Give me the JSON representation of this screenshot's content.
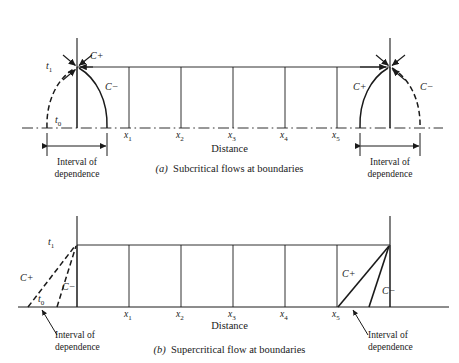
{
  "figure": {
    "axis_label": "Distance",
    "interval_label_line1": "Interval of",
    "interval_label_line2": "dependence",
    "tick_labels": [
      "x1",
      "x2",
      "x3",
      "x4",
      "x5"
    ],
    "tick_bases": [
      "x",
      "x",
      "x",
      "x",
      "x"
    ],
    "tick_subs": [
      "1",
      "2",
      "3",
      "4",
      "5"
    ],
    "time_levels": {
      "t1_base": "t",
      "t1_sub": "1",
      "t0_base": "t",
      "t0_sub": "0"
    },
    "characteristics": {
      "positive": "C+",
      "negative": "C−"
    },
    "line_color": "#1a1a1a",
    "background": "#ffffff"
  },
  "panel_a": {
    "caption_marker": "(a)",
    "caption_text": "Subcritical flows at boundaries",
    "left": {
      "c_plus": "C+",
      "c_minus": "C−",
      "t1_base": "t",
      "t1_sub": "1",
      "t0_base": "t",
      "t0_sub": "0",
      "interval_line1": "Interval of",
      "interval_line2": "dependence"
    },
    "right": {
      "c_plus": "C+",
      "c_minus": "C−",
      "interval_line1": "Interval of",
      "interval_line2": "dependence"
    },
    "axis_label": "Distance"
  },
  "panel_b": {
    "caption_marker": "(b)",
    "caption_text": "Supercritical flow at boundaries",
    "left": {
      "c_plus": "C+",
      "c_minus": "C−",
      "t1_base": "t",
      "t1_sub": "1",
      "t0_base": "t",
      "t0_sub": "0",
      "interval_line1": "Interval of",
      "interval_line2": "dependence"
    },
    "right": {
      "c_plus": "C+",
      "c_minus": "C−",
      "interval_line1": "Interval of",
      "interval_line2": "dependence"
    },
    "axis_label": "Distance"
  }
}
